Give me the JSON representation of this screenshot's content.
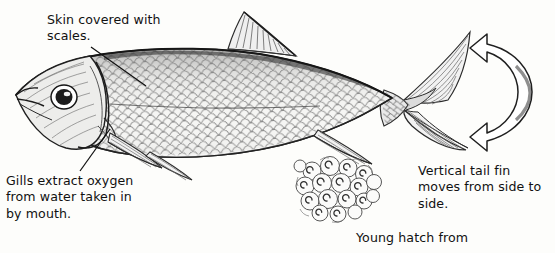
{
  "figure": {
    "background_color": "#fdfdfb",
    "ink_color": "#1a1a1a",
    "text_color": "#111111"
  },
  "captions": {
    "skin": "Skin covered with\nscales.",
    "gills": "Gills extract oxygen\nfrom water taken in\nby mouth.",
    "tail": "Vertical tail fin\nmoves from side to\nside.",
    "young": "Young hatch from"
  },
  "parts": {
    "fish_body": "fish-body",
    "head": "fish-head",
    "eye": "fish-eye",
    "gill_cover": "gill-cover",
    "dorsal_fin": "dorsal-fin",
    "pectoral_fin": "pectoral-fin",
    "pelvic_fin": "pelvic-fin",
    "anal_fin": "anal-fin",
    "caudal_fin": "caudal-tail-fin",
    "scales": "scale-pattern",
    "eggs": "egg-cluster",
    "motion_arrow": "tail-motion-arrow"
  },
  "leader_lines": [
    {
      "name": "leader-line-skin",
      "from": [
        91,
        47
      ],
      "to": [
        146,
        86
      ]
    },
    {
      "name": "leader-line-gills",
      "from": [
        80,
        171
      ],
      "to": [
        110,
        129
      ]
    }
  ]
}
